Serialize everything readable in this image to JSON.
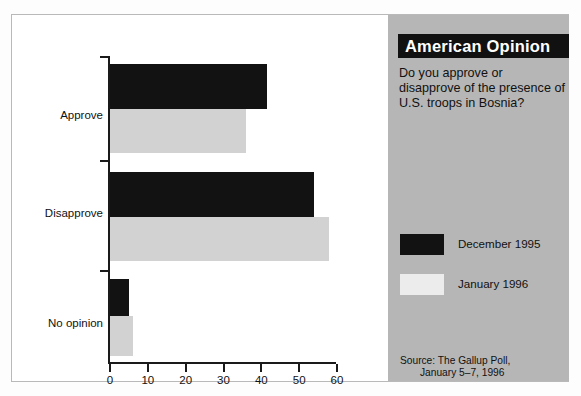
{
  "panel": {
    "title": "American Opinion",
    "question": "Do you approve or disapprove of the presence of U.S. troops in Bosnia?",
    "source_line1": "Source: The Gallup Poll,",
    "source_line2": "January 5–7, 1996",
    "background_color": "#b6b6b6",
    "title_bar_color": "#111111"
  },
  "legend": [
    {
      "label": "December 1995",
      "color": "#121212"
    },
    {
      "label": "January 1996",
      "color": "#ececec"
    }
  ],
  "chart_data": {
    "type": "bar",
    "orientation": "horizontal",
    "title": "American Opinion",
    "subtitle": "Do you approve or disapprove of the presence of U.S. troops in Bosnia?",
    "categories": [
      "Approve",
      "Disapprove",
      "No opinion"
    ],
    "series": [
      {
        "name": "December 1995",
        "color": "#121212",
        "values": [
          41.5,
          54,
          5
        ]
      },
      {
        "name": "January 1996",
        "color": "#d2d2d2",
        "values": [
          36,
          58,
          6
        ]
      }
    ],
    "xlabel": "",
    "ylabel": "",
    "xlim": [
      0,
      60
    ],
    "xticks": [
      0,
      10,
      20,
      30,
      40,
      50,
      60
    ],
    "xtick_labels": [
      "0",
      "10",
      "20",
      "30",
      "40",
      "50",
      "60"
    ],
    "grid": false,
    "legend_position": "right-panel",
    "source": "Source: The Gallup Poll, January 5–7, 1996"
  }
}
